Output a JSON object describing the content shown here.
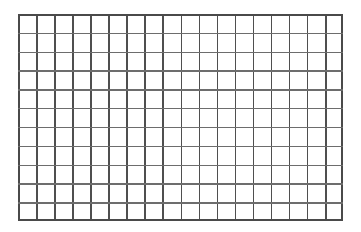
{
  "figure": {
    "kind": "grid-mesh",
    "title": "",
    "caption": "",
    "background_color": "#ffffff",
    "line_color": "#4f4f4f",
    "horizontal_line_color": "#6d6d6d",
    "border_color": "#4a4a4a",
    "columns": 18,
    "rows": 11,
    "vertical_line_count": 19,
    "horizontal_line_count": 12,
    "cell_count": 198,
    "line_width_px": 1.6,
    "cell_width_px": 18.05,
    "cell_height_px": 18.8,
    "bounds": {
      "left": 18,
      "top": 14,
      "right": 343,
      "bottom": 221,
      "width": 325,
      "height": 207
    }
  },
  "chart_data": {
    "type": "table",
    "title": "",
    "xlabel": "",
    "ylabel": "",
    "columns": 18,
    "rows": 11,
    "grid": true,
    "legend": "none",
    "categories": [],
    "values": []
  }
}
